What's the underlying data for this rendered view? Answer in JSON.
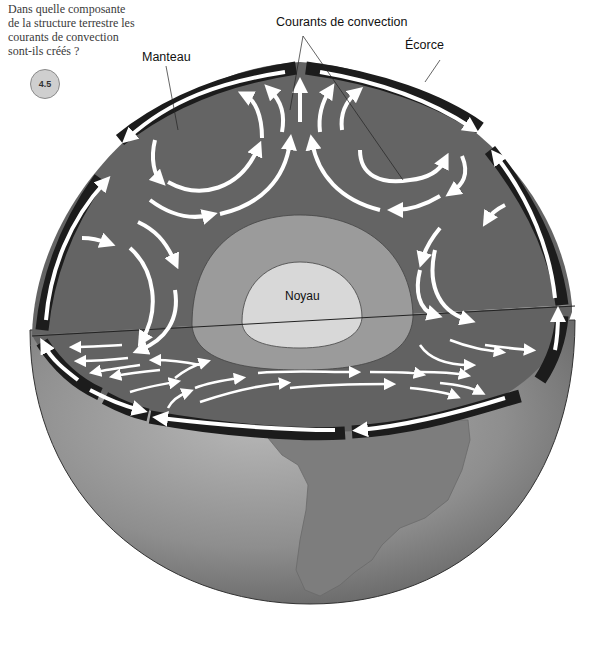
{
  "question": {
    "text": "Dans quelle composante de la structure terrestre les courants de convection sont-ils créés ?",
    "badge": "4.5"
  },
  "labels": {
    "convection": "Courants de convection",
    "crust": "Écorce",
    "mantle": "Manteau",
    "core": "Noyau"
  },
  "colors": {
    "mantle": "#636363",
    "outer_core": "#9a9a9a",
    "inner_core": "#d6d6d6",
    "crust_band": "#1a1a1a",
    "arrow": "#ffffff",
    "globe": "#8c8c8c",
    "continent": "#7a7a7a"
  }
}
